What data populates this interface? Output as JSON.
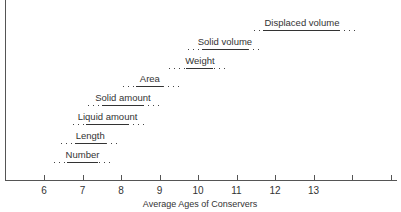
{
  "chart_data": {
    "type": "range",
    "title": "",
    "xlabel": "Average Ages of Conservers",
    "ylabel": "",
    "xlim": [
      5,
      15
    ],
    "x_ticks": [
      6,
      7,
      8,
      9,
      10,
      11,
      12,
      13,
      14,
      15
    ],
    "x_tick_labels": [
      "6",
      "7",
      "8",
      "9",
      "10",
      "11",
      "12",
      "13",
      "",
      ""
    ],
    "grid": false,
    "legend": null,
    "categories": [
      "Number",
      "Length",
      "Liquid amount",
      "Solid amount",
      "Area",
      "Weight",
      "Solid volume",
      "Displaced volume"
    ],
    "series": [
      {
        "name": "Number",
        "range_start": 6.6,
        "range_end": 7.4,
        "dotted_start": 6.2,
        "dotted_end": 7.8
      },
      {
        "name": "Length",
        "range_start": 6.8,
        "range_end": 7.6,
        "dotted_start": 6.4,
        "dotted_end": 8.0
      },
      {
        "name": "Liquid amount",
        "range_start": 7.1,
        "range_end": 8.2,
        "dotted_start": 6.7,
        "dotted_end": 8.6
      },
      {
        "name": "Solid amount",
        "range_start": 7.5,
        "range_end": 8.6,
        "dotted_start": 7.1,
        "dotted_end": 9.0
      },
      {
        "name": "Area",
        "range_start": 8.4,
        "range_end": 9.1,
        "dotted_start": 8.0,
        "dotted_end": 9.6
      },
      {
        "name": "Weight",
        "range_start": 9.7,
        "range_end": 10.4,
        "dotted_start": 9.2,
        "dotted_end": 10.8
      },
      {
        "name": "Solid volume",
        "range_start": 10.1,
        "range_end": 11.3,
        "dotted_start": 9.7,
        "dotted_end": 11.7
      },
      {
        "name": "Displaced volume",
        "range_start": 11.7,
        "range_end": 13.7,
        "dotted_start": 11.4,
        "dotted_end": 14.1
      }
    ]
  },
  "axis": {
    "x_title": "Average Ages of Conservers"
  }
}
